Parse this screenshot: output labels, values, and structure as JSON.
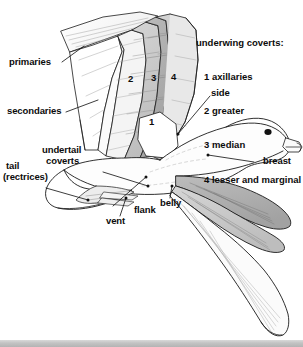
{
  "figure": {
    "background_color": "#ffffff",
    "ink_color": "#111111",
    "shade_light": "#e2e2e2",
    "shade_mid": "#c9c9c9",
    "shade_dark": "#a8a8a8"
  },
  "legend": {
    "heading": "underwing coverts:",
    "items": [
      {
        "number": "1",
        "label": "axillaries",
        "text": "1 axillaries"
      },
      {
        "number": "2",
        "label": "greater",
        "text": "2 greater"
      },
      {
        "number": "3",
        "label": "median",
        "text": "3 median"
      },
      {
        "number": "4",
        "label": "lesser and marginal",
        "text": "4 lesser and marginal"
      }
    ]
  },
  "wing_numbers": [
    {
      "id": "1",
      "text": "1"
    },
    {
      "id": "2",
      "text": "2"
    },
    {
      "id": "3",
      "text": "3"
    },
    {
      "id": "4",
      "text": "4"
    }
  ],
  "callouts": {
    "primaries": "primaries",
    "secondaries": "secondaries",
    "undertail_coverts_line1": "undertail",
    "undertail_coverts_line2": "coverts",
    "tail_line1": "tail",
    "tail_line2": "(rectrices)",
    "vent": "vent",
    "flank": "flank",
    "belly": "belly",
    "side": "side",
    "breast": "breast"
  }
}
